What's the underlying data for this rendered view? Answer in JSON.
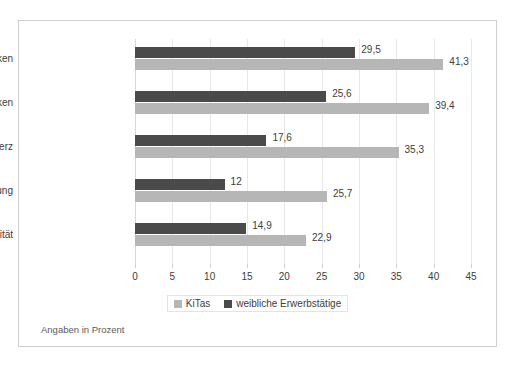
{
  "chart_data": {
    "type": "bar",
    "orientation": "horizontal",
    "title": "",
    "subtitle": "",
    "xlabel": "",
    "ylabel": "",
    "footnote": "Angaben in Prozent",
    "xlim": [
      0,
      45
    ],
    "xticks": [
      "0",
      "5",
      "10",
      "15",
      "20",
      "25",
      "30",
      "35",
      "40",
      "45"
    ],
    "xtick_step": 5,
    "grid": true,
    "grid_axis": "x",
    "legend_position": "bottom-center",
    "categories": [
      "Rücken",
      "Schulter-Nacken",
      "Kopfschmerz",
      "Schnelle Ermüdung",
      "Nervosität"
    ],
    "series": [
      {
        "name": "weibliche Erwerbstätige",
        "color": "#4a4a4a",
        "values": [
          29.5,
          25.6,
          17.6,
          12,
          14.9
        ],
        "labels": [
          "29,5",
          "25,6",
          "17,6",
          "12",
          "14,9"
        ]
      },
      {
        "name": "KiTas",
        "color": "#b6b6b6",
        "values": [
          41.3,
          39.4,
          35.3,
          25.7,
          22.9
        ],
        "labels": [
          "41,3",
          "39,4",
          "35,3",
          "25,7",
          "22,9"
        ]
      }
    ],
    "legend": [
      {
        "label": "KiTas",
        "color": "#b6b6b6"
      },
      {
        "label": "weibliche Erwerbstätige",
        "color": "#4a4a4a"
      }
    ]
  },
  "colors": {
    "series_dark": "#4a4a4a",
    "series_light": "#b6b6b6",
    "frame": "#cfcfcf",
    "grid": "#e8e8e8",
    "text": "#3d3d3d",
    "background": "#ffffff"
  }
}
